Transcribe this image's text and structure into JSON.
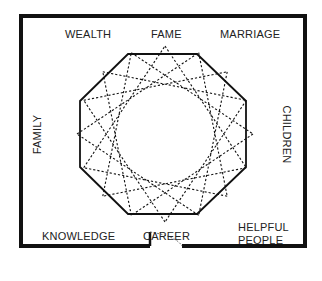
{
  "diagram": {
    "areas": {
      "top_left": "WEALTH",
      "top_center": "FAME",
      "top_right": "MARRIAGE",
      "left": "FAMILY",
      "right": "CHILDREN",
      "bottom_left": "KNOWLEDGE",
      "bottom_center": "CAREER",
      "bottom_right_line1": "HELPFUL",
      "bottom_right_line2": "PEOPLE"
    },
    "shapes": {
      "room_outline": "thick black wall with door opening at bottom center",
      "octagon": "solid black octagon",
      "star": "dashed 16-point star polygon {16/5}",
      "door": "dotted door swing arc"
    },
    "colors": {
      "line": "#111111",
      "text": "#222222",
      "background": "#ffffff"
    }
  }
}
